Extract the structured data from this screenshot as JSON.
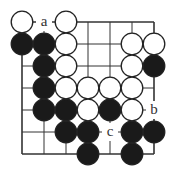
{
  "diagram": {
    "type": "go-board",
    "size": 7,
    "grid": {
      "origin_x": 22,
      "origin_y": 22,
      "spacing": 22
    },
    "colors": {
      "line": "#333333",
      "black": "#1a1a1a",
      "white": "#ffffff",
      "stone_outline": "#222222"
    },
    "stones": [
      {
        "color": "white",
        "col": 0,
        "row": 0
      },
      {
        "color": "white",
        "col": 2,
        "row": 0
      },
      {
        "color": "black",
        "col": 0,
        "row": 1
      },
      {
        "color": "black",
        "col": 1,
        "row": 1
      },
      {
        "color": "white",
        "col": 2,
        "row": 1
      },
      {
        "color": "white",
        "col": 5,
        "row": 1
      },
      {
        "color": "white",
        "col": 6,
        "row": 1
      },
      {
        "color": "black",
        "col": 1,
        "row": 2
      },
      {
        "color": "white",
        "col": 2,
        "row": 2
      },
      {
        "color": "white",
        "col": 5,
        "row": 2
      },
      {
        "color": "black",
        "col": 6,
        "row": 2
      },
      {
        "color": "black",
        "col": 1,
        "row": 3
      },
      {
        "color": "white",
        "col": 2,
        "row": 3
      },
      {
        "color": "white",
        "col": 3,
        "row": 3
      },
      {
        "color": "white",
        "col": 4,
        "row": 3
      },
      {
        "color": "white",
        "col": 5,
        "row": 3
      },
      {
        "color": "black",
        "col": 1,
        "row": 4
      },
      {
        "color": "black",
        "col": 2,
        "row": 4
      },
      {
        "color": "white",
        "col": 3,
        "row": 4
      },
      {
        "color": "black",
        "col": 4,
        "row": 4
      },
      {
        "color": "white",
        "col": 5,
        "row": 4
      },
      {
        "color": "black",
        "col": 2,
        "row": 5
      },
      {
        "color": "black",
        "col": 3,
        "row": 5
      },
      {
        "color": "black",
        "col": 5,
        "row": 5
      },
      {
        "color": "black",
        "col": 6,
        "row": 5
      },
      {
        "color": "black",
        "col": 3,
        "row": 6
      },
      {
        "color": "black",
        "col": 5,
        "row": 6
      }
    ],
    "labels": [
      {
        "text": "a",
        "col": 1,
        "row": 0
      },
      {
        "text": "b",
        "col": 6,
        "row": 4
      },
      {
        "text": "c",
        "col": 4,
        "row": 5
      }
    ]
  }
}
